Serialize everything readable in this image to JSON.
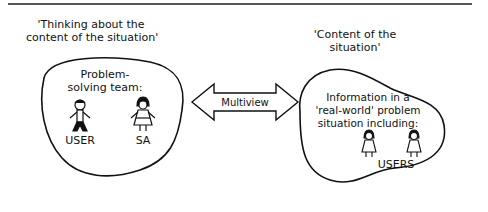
{
  "left": {
    "heading_line1": "'Thinking about the",
    "heading_line2": "content of the situation'",
    "team_line1": "Problem-",
    "team_line2": "solving team:",
    "figure1_label": "USER",
    "figure2_label": "SA"
  },
  "arrow": {
    "label": "Multiview"
  },
  "right": {
    "heading_line1": "'Content of the",
    "heading_line2": "situation'",
    "info_line1": "Information in a",
    "info_line2": "'real-world' problem",
    "info_line3": "situation including:",
    "figures_label": "USERS"
  }
}
